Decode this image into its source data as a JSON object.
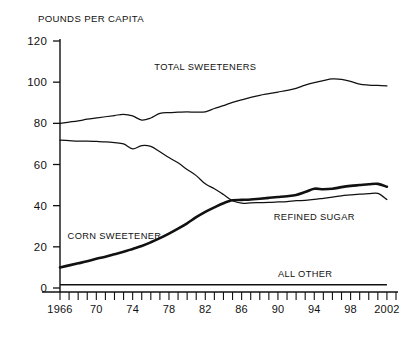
{
  "chart_data": {
    "type": "line",
    "title": "",
    "ylabel": "POUNDS PER CAPITA",
    "xlabel": "",
    "ylim": [
      0,
      120
    ],
    "xlim": [
      1966,
      2003
    ],
    "yticks": [
      0,
      20,
      40,
      60,
      80,
      100,
      120
    ],
    "ytick_labels": [
      "0",
      "20",
      "40",
      "60",
      "80",
      "100",
      "120"
    ],
    "xticks": [
      1966,
      1967,
      1968,
      1969,
      1970,
      1971,
      1972,
      1973,
      1974,
      1975,
      1976,
      1977,
      1978,
      1979,
      1980,
      1981,
      1982,
      1983,
      1984,
      1985,
      1986,
      1987,
      1988,
      1989,
      1990,
      1991,
      1992,
      1993,
      1994,
      1995,
      1996,
      1997,
      1998,
      1999,
      2000,
      2001,
      2002,
      2003
    ],
    "xtick_labels": [
      {
        "year": 1966,
        "label": "1966"
      },
      {
        "year": 1970,
        "label": "70"
      },
      {
        "year": 1974,
        "label": "74"
      },
      {
        "year": 1978,
        "label": "78"
      },
      {
        "year": 1982,
        "label": "82"
      },
      {
        "year": 1986,
        "label": "86"
      },
      {
        "year": 1990,
        "label": "90"
      },
      {
        "year": 1994,
        "label": "94"
      },
      {
        "year": 1998,
        "label": "98"
      },
      {
        "year": 2002,
        "label": "2002"
      }
    ],
    "grid": false,
    "legend_position": "inline-annotations",
    "x": [
      1966,
      1967,
      1968,
      1969,
      1970,
      1971,
      1972,
      1973,
      1974,
      1975,
      1976,
      1977,
      1978,
      1979,
      1980,
      1981,
      1982,
      1983,
      1984,
      1985,
      1986,
      1987,
      1988,
      1989,
      1990,
      1991,
      1992,
      1993,
      1994,
      1995,
      1996,
      1997,
      1998,
      1999,
      2000,
      2001,
      2002
    ],
    "series": [
      {
        "name": "TOTAL SWEETENERS",
        "style": "thin",
        "label_x": 1982,
        "label_y": 106,
        "values": [
          80.0,
          80.6,
          81.2,
          82.0,
          82.6,
          83.2,
          83.8,
          84.4,
          83.6,
          81.6,
          82.6,
          84.8,
          85.2,
          85.4,
          85.6,
          85.4,
          85.6,
          87.2,
          88.6,
          90.2,
          91.4,
          92.6,
          93.6,
          94.4,
          95.2,
          96.0,
          97.0,
          98.6,
          99.8,
          100.8,
          101.6,
          101.4,
          100.4,
          99.0,
          98.6,
          98.4,
          98.2
        ]
      },
      {
        "name": "REFINED SUGAR",
        "style": "thin",
        "label_x": 1994,
        "label_y": 33,
        "values": [
          71.8,
          71.6,
          71.4,
          71.4,
          71.2,
          71.0,
          70.6,
          70.0,
          67.6,
          69.2,
          68.8,
          66.2,
          63.4,
          60.8,
          57.6,
          54.6,
          50.6,
          48.2,
          45.4,
          42.4,
          41.2,
          41.4,
          41.5,
          41.6,
          41.8,
          42.0,
          42.4,
          42.6,
          43.0,
          43.6,
          44.2,
          44.8,
          45.2,
          45.6,
          45.8,
          46.0,
          43.0
        ]
      },
      {
        "name": "CORN SWEETENER",
        "style": "thick",
        "label_x": 1972,
        "label_y": 24,
        "values": [
          10.0,
          11.0,
          12.0,
          13.0,
          14.2,
          15.2,
          16.4,
          17.6,
          19.0,
          20.4,
          22.2,
          24.2,
          26.4,
          28.8,
          31.4,
          34.4,
          37.0,
          39.2,
          41.2,
          42.6,
          42.8,
          43.0,
          43.4,
          43.8,
          44.2,
          44.6,
          45.2,
          46.6,
          48.2,
          48.0,
          48.2,
          49.0,
          49.6,
          50.0,
          50.4,
          50.6,
          49.2
        ]
      },
      {
        "name": "ALL OTHER",
        "style": "flat",
        "label_x": 1993,
        "label_y": 5.5,
        "values": [
          1.6,
          1.6,
          1.6,
          1.6,
          1.6,
          1.6,
          1.6,
          1.6,
          1.6,
          1.6,
          1.6,
          1.6,
          1.6,
          1.6,
          1.6,
          1.6,
          1.6,
          1.6,
          1.6,
          1.6,
          1.6,
          1.6,
          1.6,
          1.6,
          1.6,
          1.6,
          1.6,
          1.6,
          1.6,
          1.6,
          1.6,
          1.6,
          1.6,
          1.6,
          1.6,
          1.6,
          1.6
        ]
      }
    ]
  },
  "colors": {
    "ink": "#111111",
    "background": "#ffffff"
  }
}
